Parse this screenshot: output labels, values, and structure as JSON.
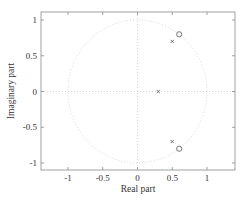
{
  "chart_data": {
    "type": "scatter",
    "title": "",
    "xlabel": "Real part",
    "ylabel": "Imaginary part",
    "xlim": [
      -1.35,
      1.4
    ],
    "ylim": [
      -1.1,
      1.1
    ],
    "x_ticks": [
      -1,
      -0.5,
      0,
      0.5,
      1
    ],
    "x_tick_labels": [
      "-1",
      "-0.5",
      "0",
      "0.5",
      "1"
    ],
    "y_ticks": [
      1,
      0.5,
      0,
      -0.5,
      -1
    ],
    "y_tick_labels": [
      "1",
      "0.5",
      "0",
      "-0.5",
      "-1"
    ],
    "grid": false,
    "unit_circle": true,
    "series": [
      {
        "name": "zeros",
        "marker": "o",
        "points": [
          [
            0.6,
            0.8
          ],
          [
            0.6,
            -0.8
          ]
        ]
      },
      {
        "name": "poles",
        "marker": "x",
        "points": [
          [
            0.5,
            0.7
          ],
          [
            0.5,
            -0.7
          ],
          [
            0.3,
            0
          ]
        ]
      }
    ],
    "colors": {
      "frame": "#8a8a8a",
      "markers": "#555555",
      "unit_circle": "#d8d8d8",
      "text": "#333333"
    }
  }
}
